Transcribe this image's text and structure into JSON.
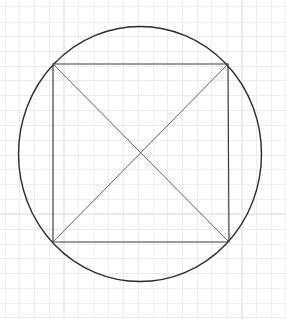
{
  "canvas": {
    "width": 286,
    "height": 319,
    "background_color": "#ffffff",
    "description": "Hand-drawn style geometry sketch on graph paper: a circle with an inscribed square and the square's two diagonals forming an X."
  },
  "grid": {
    "name": "graph-paper-grid",
    "spacing_px": 14.8,
    "origin_x": 5,
    "origin_y": 7,
    "color": "#e9ebee",
    "stroke_width": 1,
    "visible": true,
    "vertical_count": 20,
    "horizontal_count": 22
  },
  "shapes": {
    "circle": {
      "name": "circumscribed-circle",
      "type": "ellipse",
      "cx": 140,
      "cy": 154,
      "rx": 121.5,
      "ry": 127.5,
      "stroke_color": "#2a2a2e",
      "stroke_width": 1.4,
      "fill": "none"
    },
    "square": {
      "name": "inscribed-square",
      "type": "polygon",
      "points": [
        {
          "x": 53,
          "y": 64
        },
        {
          "x": 228,
          "y": 64
        },
        {
          "x": 229,
          "y": 242
        },
        {
          "x": 53,
          "y": 242
        }
      ],
      "stroke_color": "#3a3a3f",
      "stroke_width": 1.15,
      "fill": "none"
    },
    "diagonals": [
      {
        "name": "diagonal-tl-br",
        "type": "line",
        "x1": 53,
        "y1": 64,
        "x2": 229,
        "y2": 242,
        "stroke_color": "#55555c",
        "stroke_width": 0.95
      },
      {
        "name": "diagonal-tr-bl",
        "type": "line",
        "x1": 228,
        "y1": 64,
        "x2": 53,
        "y2": 242,
        "stroke_color": "#55555c",
        "stroke_width": 0.95
      }
    ],
    "intersection_point": {
      "name": "diagonal-intersection",
      "x": 141,
      "y": 153
    }
  },
  "labels": {
    "has_text": false,
    "text_items": []
  }
}
